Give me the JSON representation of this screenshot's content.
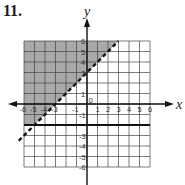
{
  "problem": {
    "number_label": "11."
  },
  "chart_data": {
    "type": "graph-inequality",
    "title": "11.",
    "xlabel": "x",
    "ylabel": "y",
    "xlim": [
      -6,
      6
    ],
    "ylim": [
      -6,
      6
    ],
    "grid": true,
    "x_tick_labels": [
      "-6",
      "-5",
      "-4",
      "-3",
      "-1",
      "1",
      "2",
      "3",
      "4",
      "5",
      "6"
    ],
    "y_tick_labels": [
      "6",
      "5",
      "4",
      "3",
      "1",
      "-1",
      "-3",
      "-4",
      "-5",
      "-6"
    ],
    "origin_label": "0",
    "boundaries": [
      {
        "equation": "y = x + 3",
        "style": "dashed",
        "slope": 1,
        "intercept": 3
      },
      {
        "equation": "y = -2",
        "style": "solid",
        "slope": 0,
        "intercept": -2
      }
    ],
    "shaded_region": "y > x + 3 and y >= -2",
    "colors": {
      "shade": "#a9a9a9",
      "grid": "#444444",
      "background": "#ffffff"
    }
  }
}
